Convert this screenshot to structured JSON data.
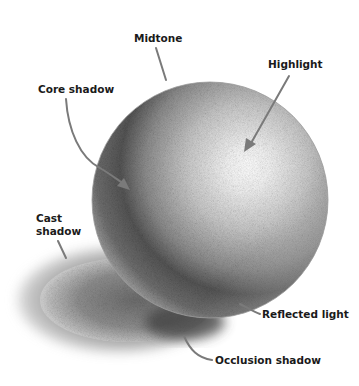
{
  "diagram": {
    "labels": [
      {
        "id": "midtone",
        "text": "Midtone"
      },
      {
        "id": "highlight",
        "text": "Highlight"
      },
      {
        "id": "core_shadow",
        "text": "Core shadow"
      },
      {
        "id": "cast_shadow",
        "text": "Cast\nshadow"
      },
      {
        "id": "reflected_light",
        "text": "Reflected light"
      },
      {
        "id": "occlusion_shadow",
        "text": "Occlusion shadow"
      }
    ],
    "colors": {
      "background": "#ffffff",
      "label_text": "#1a1a1a",
      "leader_line": "#7a7a7a",
      "pencil_dark": "#3a3a3a",
      "pencil_mid": "#8a8a8a",
      "pencil_light": "#d8d8d8"
    }
  }
}
